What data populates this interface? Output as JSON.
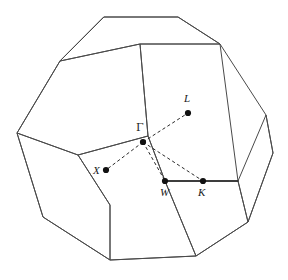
{
  "figure": {
    "name": "first-brillouin-zone-fcc",
    "background_color": "#ffffff",
    "line_color": "#4a4a4a",
    "dot_color": "#111111",
    "label_color": "#1a1a1a",
    "width": 288,
    "height": 280
  },
  "chart_data": {
    "type": "diagram",
    "title": "",
    "subtitle": "",
    "xlabel": "",
    "ylabel": "",
    "grid": false,
    "legend": "none",
    "shape": "truncated octahedron",
    "symmetry_points": [
      {
        "label": "Γ",
        "name": "gamma-point",
        "x": 143,
        "y": 142,
        "label_x": 136,
        "label_y": 131,
        "italic": false
      },
      {
        "label": "L",
        "name": "l-point",
        "x": 188,
        "y": 113,
        "label_x": 184,
        "label_y": 102,
        "italic": true
      },
      {
        "label": "X",
        "name": "x-point",
        "x": 106,
        "y": 170,
        "label_x": 93,
        "label_y": 174,
        "italic": true
      },
      {
        "label": "W",
        "name": "w-point",
        "x": 165,
        "y": 181,
        "label_x": 160,
        "label_y": 196,
        "italic": true
      },
      {
        "label": "K",
        "name": "k-point",
        "x": 203,
        "y": 181,
        "label_x": 198,
        "label_y": 196,
        "italic": true
      }
    ],
    "path_segments": [
      {
        "name": "gamma-to-l",
        "style": "dashed",
        "from": "Γ",
        "to": "L",
        "d": "M143,142 L188,113"
      },
      {
        "name": "gamma-to-x",
        "style": "dashed",
        "from": "Γ",
        "to": "X",
        "d": "M143,142 L106,170"
      },
      {
        "name": "gamma-to-w",
        "style": "dashed",
        "from": "Γ",
        "to": "W",
        "d": "M143,142 L165,181"
      },
      {
        "name": "gamma-to-k",
        "style": "dashed",
        "from": "Γ",
        "to": "K",
        "d": "M143,142 L203,181"
      },
      {
        "name": "w-to-k",
        "style": "solid",
        "from": "W",
        "to": "K",
        "d": "M165,181 L203,181"
      },
      {
        "name": "k-to-edge",
        "style": "solid",
        "from": "K",
        "to": "edge",
        "d": "M203,181 L238,181"
      }
    ],
    "polyhedron_outline": "M104,17 L178,17 L220,44 L266,115 L273,153 L248,222 L196,256 L110,260 L43,217 L17,133 L60,61 Z",
    "polyhedron_faces": [
      {
        "name": "top-hexagon-face",
        "d": "M104,17 L178,17 L220,44 L140,44 L60,61 Z"
      },
      {
        "name": "upper-left-face",
        "d": "M60,61 L140,44 L148,136 L78,155 L17,133 Z"
      },
      {
        "name": "upper-right-face",
        "d": "M140,44 L220,44 L238,181 L165,181 L148,136 Z"
      },
      {
        "name": "lower-left-face",
        "d": "M17,133 L78,155 L110,205 L110,260 L43,217 Z"
      },
      {
        "name": "bottom-center-face",
        "d": "M78,155 L148,136 L165,181 L196,256 L110,260 L110,205 Z"
      },
      {
        "name": "right-quad-face",
        "d": "M238,181 L266,115 L273,153 L248,222 Z"
      },
      {
        "name": "right-lower-face",
        "d": "M238,181 L248,222 L196,256 L165,181 Z"
      }
    ]
  }
}
